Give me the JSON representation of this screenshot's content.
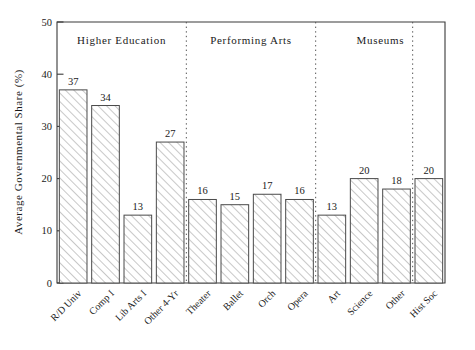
{
  "chart_data": {
    "type": "bar",
    "title": "",
    "xlabel": "",
    "ylabel": "Average Governmental Share (%)",
    "ylim": [
      0,
      50
    ],
    "yticks": [
      0,
      10,
      20,
      30,
      40,
      50
    ],
    "grid": false,
    "legend": "none",
    "categories": [
      "R/D Univ",
      "Comp I",
      "Lib Arts I",
      "Other 4-Yr",
      "Theater",
      "Ballet",
      "Orch",
      "Opera",
      "Art",
      "Science",
      "Other",
      "Hist Soc"
    ],
    "values": [
      37,
      34,
      13,
      27,
      16,
      15,
      17,
      16,
      13,
      20,
      18,
      20
    ],
    "bar_labels": [
      "37",
      "34",
      "13",
      "27",
      "16",
      "15",
      "17",
      "16",
      "13",
      "20",
      "18",
      "20"
    ],
    "annotations": [
      {
        "text": "Higher Education",
        "span_start": 0,
        "span_end": 3
      },
      {
        "text": "Performing Arts",
        "span_start": 4,
        "span_end": 7
      },
      {
        "text": "Museums",
        "span_start": 8,
        "span_end": 11
      }
    ],
    "dividers_after_category": [
      "Other 4-Yr",
      "Opera",
      "Other"
    ],
    "bar_fill": "diagonal-hatch",
    "bar_edge_color": "#4a4a4a"
  },
  "axis": {
    "y_tick_labels": [
      "0",
      "10",
      "20",
      "30",
      "40",
      "50"
    ],
    "y_title": "Average Governmental Share (%)"
  },
  "groups": {
    "g1": "Higher Education",
    "g2": "Performing Arts",
    "g3": "Museums"
  }
}
